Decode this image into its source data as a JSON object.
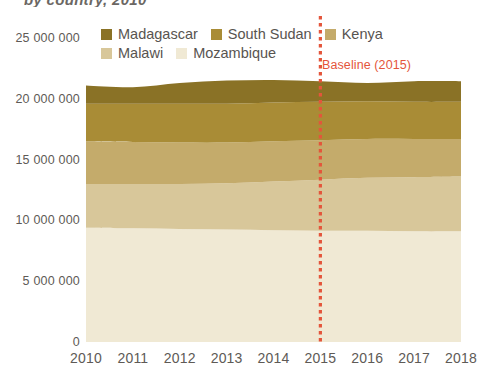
{
  "title_sliver": "by country, 2010",
  "legend": {
    "rows": [
      [
        {
          "label": "Madagascar",
          "color": "#8a7226"
        },
        {
          "label": "South Sudan",
          "color": "#a98c36"
        },
        {
          "label": "Kenya",
          "color": "#c4ab6b"
        }
      ],
      [
        {
          "label": "Malawi",
          "color": "#d8c79a"
        },
        {
          "label": "Mozambique",
          "color": "#f0e9d4"
        }
      ]
    ]
  },
  "annotation": {
    "baseline_label": "Baseline (2015)",
    "baseline_year": "2015",
    "baseline_color": "#e4553b"
  },
  "axes": {
    "y_ticks": [
      "25 000 000",
      "20 000 000",
      "15 000 000",
      "10 000 000",
      "5 000 000",
      "0"
    ],
    "y_tick_values": [
      25000000,
      20000000,
      15000000,
      10000000,
      5000000,
      0
    ],
    "x_ticks": [
      "2010",
      "2011",
      "2012",
      "2013",
      "2014",
      "2015",
      "2016",
      "2017",
      "2018"
    ]
  },
  "chart_data": {
    "type": "area",
    "stacked": true,
    "title": "by country, 2010",
    "xlabel": "",
    "ylabel": "",
    "ylim": [
      0,
      25000000
    ],
    "grid": false,
    "legend_position": "top",
    "x": [
      2010,
      2011,
      2012,
      2013,
      2014,
      2015,
      2016,
      2017,
      2018
    ],
    "series": [
      {
        "name": "Mozambique",
        "color": "#f0e9d4",
        "values": [
          9400000,
          9350000,
          9300000,
          9250000,
          9200000,
          9150000,
          9150000,
          9100000,
          9100000
        ]
      },
      {
        "name": "Malawi",
        "color": "#d8c79a",
        "values": [
          3600000,
          3650000,
          3700000,
          3800000,
          4000000,
          4200000,
          4350000,
          4450000,
          4500000
        ]
      },
      {
        "name": "Kenya",
        "color": "#c4ab6b",
        "values": [
          3500000,
          3450000,
          3400000,
          3350000,
          3300000,
          3250000,
          3200000,
          3150000,
          3100000
        ]
      },
      {
        "name": "South Sudan",
        "color": "#a98c36",
        "values": [
          3100000,
          3150000,
          3200000,
          3200000,
          3200000,
          3150000,
          3100000,
          3050000,
          3050000
        ]
      },
      {
        "name": "Madagascar",
        "color": "#8a7226",
        "values": [
          1500000,
          1350000,
          1700000,
          1900000,
          1850000,
          1700000,
          1500000,
          1700000,
          1700000
        ]
      }
    ],
    "totals": [
      21100000,
      20950000,
      21300000,
      21500000,
      21550000,
      21450000,
      21300000,
      21450000,
      21450000
    ],
    "annotations": [
      {
        "text": "Baseline (2015)",
        "x": 2015,
        "type": "vertical-dotted-line",
        "color": "#e4553b"
      }
    ]
  }
}
